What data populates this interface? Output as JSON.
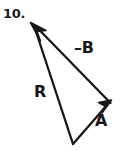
{
  "figure": {
    "problem_number": "10.",
    "background_color": "#ffffff",
    "ink_color": "#18181a",
    "labels": [
      {
        "name": "label-neg-b",
        "text": "–B"
      },
      {
        "name": "label-r",
        "text": "R"
      },
      {
        "name": "label-a",
        "text": "A"
      }
    ],
    "vectors": [
      {
        "name": "vector-r",
        "label": "R",
        "from": [
          73,
          144
        ],
        "to": [
          31,
          23
        ],
        "arrowhead": "at-tip"
      },
      {
        "name": "vector-a",
        "label": "A",
        "from": [
          73,
          144
        ],
        "to": [
          111,
          101
        ],
        "arrowhead": "at-tip"
      },
      {
        "name": "vector-neg-b",
        "label": "–B",
        "from": [
          111,
          103
        ],
        "to": [
          31,
          23
        ],
        "arrowhead": "at-tip"
      }
    ]
  }
}
